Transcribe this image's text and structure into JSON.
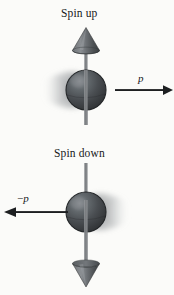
{
  "figure": {
    "background_color": "#fbfbf9",
    "ink_color": "#17181a",
    "axis_color": "#7e8184",
    "sphere_color": "#3e4144",
    "sphere_highlight_color": "#72767a",
    "blur_color": "#9a9da0",
    "width": 174,
    "height": 295
  },
  "panels": {
    "top": {
      "caption": "Spin up",
      "spin_direction": "up",
      "momentum_label": "p",
      "momentum_sign": "",
      "momentum_direction": "right",
      "sphere_center_x": 86,
      "sphere_center_y": 90,
      "sphere_radius": 20,
      "motion_blur_side": "left",
      "axis_top_y": 30,
      "axis_bottom_y": 125,
      "arrow_start_x": 115,
      "arrow_end_x": 172,
      "arrow_y": 90
    },
    "bottom": {
      "caption": "Spin down",
      "spin_direction": "down",
      "momentum_label": "p",
      "momentum_sign": "−",
      "momentum_direction": "left",
      "sphere_center_x": 86,
      "sphere_center_y": 212,
      "sphere_radius": 20,
      "motion_blur_side": "right",
      "axis_top_y": 163,
      "axis_bottom_y": 266,
      "arrow_start_x": 68,
      "arrow_end_x": 4,
      "arrow_y": 212
    }
  },
  "icons": {
    "cone_up": "cone-arrowhead-up-icon",
    "cone_down": "cone-arrowhead-down-icon",
    "sphere": "shaded-sphere-icon",
    "arrow_right": "momentum-arrow-right-icon",
    "arrow_left": "momentum-arrow-left-icon"
  }
}
